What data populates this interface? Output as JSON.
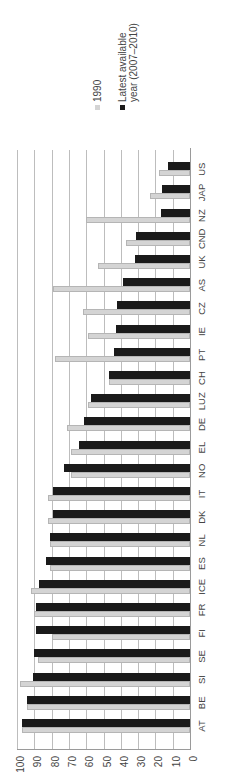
{
  "chart_data": {
    "type": "bar",
    "orientation": "vertical bars, whole figure rotated 90 degrees counter-clockwise",
    "title": "",
    "xlabel": "",
    "ylabel": "",
    "ylim": [
      0,
      100
    ],
    "yticks": [
      "0",
      "10",
      "20",
      "30",
      "40",
      "50",
      "60",
      "70",
      "80",
      "90",
      "100"
    ],
    "grid": true,
    "legend_position": "right",
    "categories": [
      "AT",
      "BE",
      "SI",
      "SE",
      "FI",
      "FR",
      "ICE",
      "ES",
      "NL",
      "DK",
      "IT",
      "NO",
      "EL",
      "DE",
      "LUZ",
      "CH",
      "PT",
      "IE",
      "CZ",
      "AS",
      "UK",
      "CND",
      "NZ",
      "JAP",
      "US"
    ],
    "series": [
      {
        "name": "1990",
        "color": "#d4d4d4",
        "values": [
          97,
          94,
          98,
          88,
          80,
          90,
          92,
          81,
          81,
          82,
          82,
          69,
          69,
          71,
          59,
          47,
          78,
          59,
          62,
          79,
          53,
          37,
          60,
          23,
          18
        ]
      },
      {
        "name": "Latest available year (2007–2010)",
        "color": "#1a1a1a",
        "values": [
          97,
          94,
          91,
          90,
          89,
          89,
          87,
          83,
          81,
          79,
          79,
          73,
          64,
          61,
          57,
          47,
          44,
          43,
          42,
          39,
          32,
          31,
          17,
          16,
          13
        ]
      }
    ]
  },
  "legend": {
    "item1": "1990",
    "item2_line1": "Latest available",
    "item2_line2": "year (2007–2010)"
  }
}
